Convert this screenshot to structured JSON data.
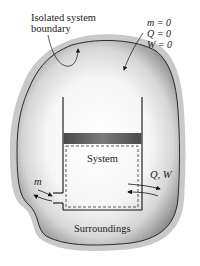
{
  "figure": {
    "boundary_label_line1": "Isolated system",
    "boundary_label_line2": "boundary",
    "conditions": {
      "m": "m = 0",
      "Q": "Q = 0",
      "W": "W = 0"
    },
    "system_label": "System",
    "mass_flow_label": "m",
    "energy_label": "Q, W",
    "surroundings_label": "Surroundings"
  },
  "colors": {
    "blob_halo": "#c8c8c8",
    "blob_edge": "#1a1a1a",
    "blob_shade": "#8a8a8a",
    "piston": "#555555",
    "line": "#111111"
  }
}
